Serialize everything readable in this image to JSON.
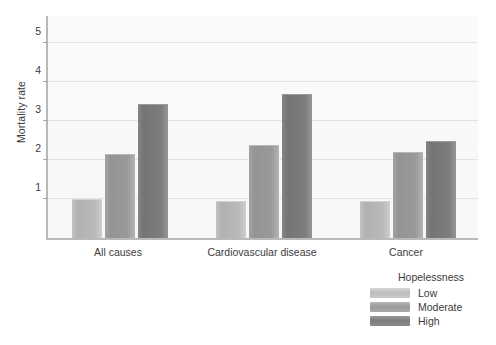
{
  "chart_data": {
    "type": "bar",
    "title": "",
    "xlabel": "",
    "ylabel": "Mortality rate",
    "categories": [
      "All causes",
      "Cardiovascular disease",
      "Cancer"
    ],
    "series": [
      {
        "name": "Low",
        "values": [
          1.0,
          0.95,
          0.95
        ]
      },
      {
        "name": "Moderate",
        "values": [
          2.15,
          2.4,
          2.2
        ]
      },
      {
        "name": "High",
        "values": [
          3.45,
          3.7,
          2.5
        ]
      }
    ],
    "legend_title": "Hopelessness",
    "legend_position": "bottom-right",
    "ylim": [
      0,
      5.75
    ],
    "yticks": [
      1,
      2,
      3,
      4,
      5
    ],
    "ytick_labels": [
      "1",
      "2",
      "3",
      "4",
      "5"
    ],
    "grid": true,
    "grid_axis": "y",
    "colors": {
      "low": "#b9b9b9",
      "moderate": "#9a9a9a",
      "high": "#7c7c7c",
      "plot_background": "#f8f8f8",
      "gridline": "#e3e3e3",
      "axis": "#b9b9b9",
      "text": "#3b3b3b"
    }
  }
}
